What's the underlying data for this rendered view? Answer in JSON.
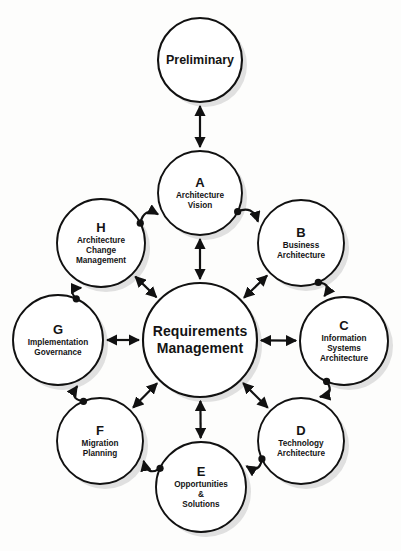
{
  "diagram": {
    "background_color": "#fdfdfc",
    "stroke_color": "#111111",
    "node_fill": "#ffffff",
    "shadow_color": "#c9c9c9"
  },
  "nodes": {
    "preliminary": {
      "letter": "",
      "title": "Preliminary",
      "cx": 200,
      "cy": 60,
      "r": 42
    },
    "center": {
      "letter": "",
      "title": "Requirements\nManagement",
      "line1": "Requirements",
      "line2": "Management",
      "cx": 200,
      "cy": 340,
      "r": 57
    },
    "a": {
      "letter": "A",
      "title": "Architecture\nVision",
      "line1": "Architecture",
      "line2": "Vision",
      "cx": 200,
      "cy": 193,
      "r": 42
    },
    "b": {
      "letter": "B",
      "title": "Business\nArchitecture",
      "line1": "Business",
      "line2": "Architecture",
      "cx": 301,
      "cy": 243,
      "r": 43
    },
    "c": {
      "letter": "C",
      "title": "Information\nSystems\nArchitecture",
      "line1": "Information",
      "line2": "Systems",
      "line3": "Architecture",
      "cx": 344,
      "cy": 341,
      "r": 44
    },
    "d": {
      "letter": "D",
      "title": "Technology\nArchitecture",
      "line1": "Technology",
      "line2": "Architecture",
      "cx": 301,
      "cy": 441,
      "r": 43
    },
    "e": {
      "letter": "E",
      "title": "Opportunities\n&\nSolutions",
      "line1": "Opportunities",
      "line2": "&",
      "line3": "Solutions",
      "cx": 201,
      "cy": 487,
      "r": 45
    },
    "f": {
      "letter": "F",
      "title": "Migration\nPlanning",
      "line1": "Migration",
      "line2": "Planning",
      "cx": 100,
      "cy": 441,
      "r": 43
    },
    "g": {
      "letter": "G",
      "title": "Implementation\nGovernance",
      "line1": "Implementation",
      "line2": "Governance",
      "cx": 58,
      "cy": 340,
      "r": 45
    },
    "h": {
      "letter": "H",
      "title": "Architecture\nChange\nManagement",
      "line1": "Architecture",
      "line2": "Change",
      "line3": "Management",
      "cx": 101,
      "cy": 243,
      "r": 44
    }
  },
  "edges": [
    {
      "id": "prelim-a",
      "from": "preliminary",
      "to": "a",
      "style": "straight",
      "arrows": "both"
    },
    {
      "id": "a-center",
      "from": "a",
      "to": "center",
      "style": "straight",
      "arrows": "both"
    },
    {
      "id": "b-center",
      "from": "b",
      "to": "center",
      "style": "straight",
      "arrows": "both"
    },
    {
      "id": "c-center",
      "from": "c",
      "to": "center",
      "style": "straight",
      "arrows": "both"
    },
    {
      "id": "d-center",
      "from": "d",
      "to": "center",
      "style": "straight",
      "arrows": "both"
    },
    {
      "id": "e-center",
      "from": "e",
      "to": "center",
      "style": "straight",
      "arrows": "both"
    },
    {
      "id": "f-center",
      "from": "f",
      "to": "center",
      "style": "straight",
      "arrows": "both"
    },
    {
      "id": "g-center",
      "from": "g",
      "to": "center",
      "style": "straight",
      "arrows": "both"
    },
    {
      "id": "h-center",
      "from": "h",
      "to": "center",
      "style": "straight",
      "arrows": "both"
    },
    {
      "id": "a-b",
      "from": "a",
      "to": "b",
      "style": "curved",
      "arrows": "end"
    },
    {
      "id": "b-c",
      "from": "b",
      "to": "c",
      "style": "curved",
      "arrows": "end"
    },
    {
      "id": "c-d",
      "from": "c",
      "to": "d",
      "style": "curved",
      "arrows": "end"
    },
    {
      "id": "d-e",
      "from": "d",
      "to": "e",
      "style": "curved",
      "arrows": "end"
    },
    {
      "id": "e-f",
      "from": "e",
      "to": "f",
      "style": "curved",
      "arrows": "end"
    },
    {
      "id": "f-g",
      "from": "f",
      "to": "g",
      "style": "curved",
      "arrows": "end"
    },
    {
      "id": "g-h",
      "from": "g",
      "to": "h",
      "style": "curved",
      "arrows": "end"
    },
    {
      "id": "h-a",
      "from": "h",
      "to": "a",
      "style": "curved",
      "arrows": "end"
    }
  ]
}
